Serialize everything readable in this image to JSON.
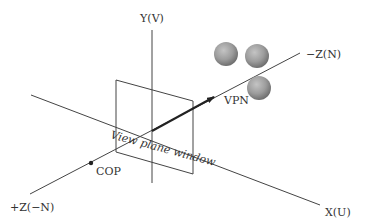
{
  "diagram": {
    "title": "",
    "labels": {
      "y_axis": "Y(V)",
      "x_axis": "X(U)",
      "neg_z_axis": "−Z(N)",
      "pos_z_axis": "+Z(−N)",
      "vpn": "VPN",
      "cop": "COP",
      "view_plane_window": "View plane window"
    },
    "colors": {
      "line": "#444444",
      "sphere_light": "#c8c8c8",
      "sphere_mid": "#9a9a9a",
      "sphere_dark": "#6e6e6e",
      "background": "#ffffff"
    },
    "objects": {
      "spheres_count": 3
    }
  }
}
